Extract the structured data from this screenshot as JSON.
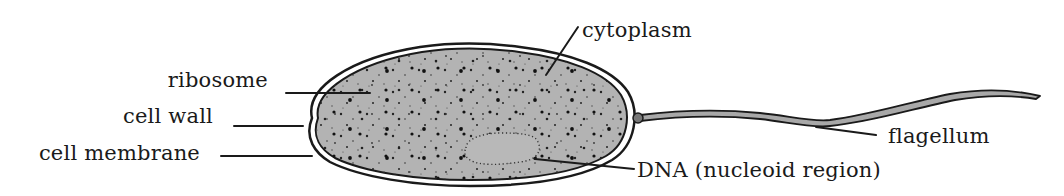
{
  "diagram": {
    "colors": {
      "outline": "#1a1a1a",
      "cytoplasm_fill": "#b3b3b3",
      "flagellum_fill": "#a8a8a8",
      "background": "#ffffff"
    },
    "labels": {
      "cytoplasm": "cytoplasm",
      "ribosome": "ribosome",
      "cell_wall": "cell wall",
      "cell_membrane": "cell membrane",
      "flagellum": "flagellum",
      "dna": "DNA (nucleoid region)"
    }
  }
}
